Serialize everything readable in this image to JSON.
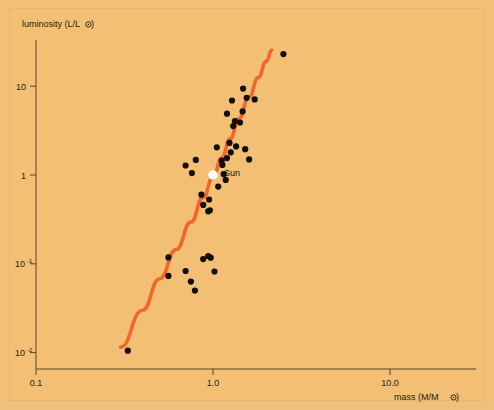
{
  "figure": {
    "background_color": "#f3bf74",
    "border_color": "#f0c07a",
    "curve_color": "#f4652a",
    "point_color": "#120d06",
    "sun_marker_color": "#ffffff"
  },
  "chart_data": {
    "type": "scatter",
    "title": "",
    "xlabel": "mass (M/M⊙)",
    "ylabel": "luminosity (L/L⊙)",
    "xscale": "log",
    "yscale": "log",
    "xlim": [
      0.1,
      25.0
    ],
    "ylim": [
      0.0065,
      60.0
    ],
    "grid": false,
    "legend": "none",
    "xticks": [
      {
        "value": 0.1,
        "label": "0.1"
      },
      {
        "value": 1.0,
        "label": "1.0"
      },
      {
        "value": 10.0,
        "label": "10.0"
      }
    ],
    "yticks": [
      {
        "value": 10,
        "label": "10",
        "exponent": ""
      },
      {
        "value": 1,
        "label": "1",
        "exponent": ""
      },
      {
        "value": 0.1,
        "label": "10",
        "exponent": "-1"
      },
      {
        "value": 0.01,
        "label": "10",
        "exponent": "-2"
      }
    ],
    "series": [
      {
        "name": "stars",
        "marker": "filled-circle",
        "points": [
          [
            0.33,
            0.0105
          ],
          [
            0.56,
            0.118
          ],
          [
            0.56,
            0.073
          ],
          [
            0.7,
            0.083
          ],
          [
            0.75,
            0.063
          ],
          [
            0.79,
            0.05
          ],
          [
            0.88,
            0.113
          ],
          [
            0.94,
            0.122
          ],
          [
            0.97,
            0.117
          ],
          [
            1.02,
            0.082
          ],
          [
            0.7,
            1.28
          ],
          [
            0.76,
            1.05
          ],
          [
            0.8,
            1.48
          ],
          [
            0.86,
            0.6
          ],
          [
            0.88,
            0.46
          ],
          [
            0.94,
            0.39
          ],
          [
            0.96,
            0.4
          ],
          [
            0.95,
            0.53
          ],
          [
            1.0,
            0.96
          ],
          [
            1.05,
            2.05
          ],
          [
            1.07,
            0.74
          ],
          [
            1.12,
            1.45
          ],
          [
            1.13,
            1.3
          ],
          [
            1.15,
            1.02
          ],
          [
            1.18,
            0.88
          ],
          [
            1.2,
            1.55
          ],
          [
            1.24,
            2.3
          ],
          [
            1.26,
            1.8
          ],
          [
            1.35,
            2.1
          ],
          [
            1.3,
            3.55
          ],
          [
            1.33,
            4.05
          ],
          [
            1.42,
            3.9
          ],
          [
            1.47,
            5.2
          ],
          [
            1.2,
            4.9
          ],
          [
            1.28,
            6.9
          ],
          [
            1.55,
            7.4
          ],
          [
            1.72,
            7.1
          ],
          [
            1.48,
            9.4
          ],
          [
            1.52,
            1.95
          ],
          [
            1.6,
            1.5
          ],
          [
            2.5,
            23.0
          ]
        ]
      },
      {
        "name": "Sun",
        "marker": "white-circle",
        "label": "Sun",
        "points": [
          [
            1.0,
            1.0
          ]
        ]
      },
      {
        "name": "mass-luminosity fit",
        "marker": "line",
        "color": "#f4652a",
        "points": [
          [
            0.3,
            0.0115
          ],
          [
            0.4,
            0.03
          ],
          [
            0.5,
            0.068
          ],
          [
            0.62,
            0.145
          ],
          [
            0.75,
            0.295
          ],
          [
            0.88,
            0.56
          ],
          [
            1.0,
            0.95
          ],
          [
            1.12,
            1.55
          ],
          [
            1.25,
            2.55
          ],
          [
            1.4,
            4.3
          ],
          [
            1.6,
            7.6
          ],
          [
            1.8,
            12.5
          ],
          [
            2.0,
            19.0
          ],
          [
            2.15,
            25.5
          ]
        ]
      }
    ],
    "annotations": [
      {
        "text": "Sun",
        "x": 1.0,
        "y": 1.0,
        "placement": "right"
      }
    ]
  }
}
